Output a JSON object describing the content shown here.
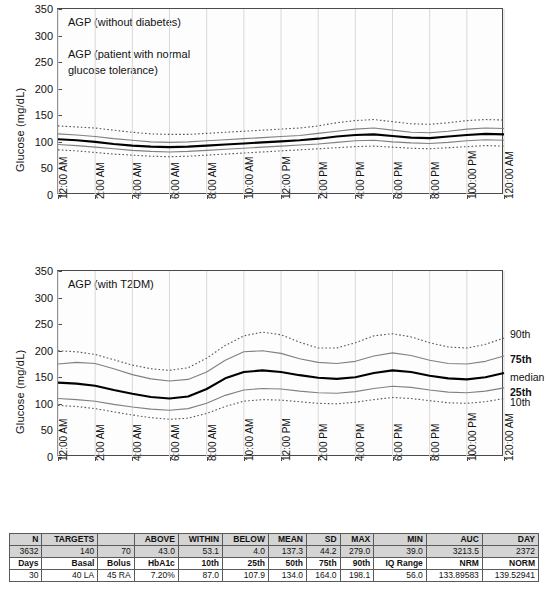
{
  "charts": [
    {
      "id": "agp-without-diabetes",
      "title": "AGP (without diabetes)\n\nAGP (patient with normal\nglucose tolerance)",
      "ylabel": "Glucose (mg/dL)",
      "yticks": [
        "0",
        "50",
        "100",
        "150",
        "200",
        "250",
        "300",
        "350"
      ],
      "xticks": [
        "12:00 AM",
        "2:00 AM",
        "4:00 AM",
        "6:00 AM",
        "8:00 AM",
        "10:00 AM",
        "12:00 PM",
        "2:00 PM",
        "4:00 PM",
        "6:00 PM",
        "8:00 PM",
        "100:00 PM",
        "120:00 AM"
      ],
      "legend": []
    },
    {
      "id": "agp-with-t2dm",
      "title": "AGP (with T2DM)",
      "ylabel": "Glucose (mg/dL)",
      "yticks": [
        "0",
        "50",
        "100",
        "150",
        "200",
        "250",
        "300",
        "350"
      ],
      "xticks": [
        "12:00 AM",
        "2:00 AM",
        "4:00 AM",
        "6:00 AM",
        "8:00 AM",
        "10:00 AM",
        "12:00 PM",
        "2:00 PM",
        "4:00 PM",
        "6:00 PM",
        "8:00 PM",
        "100:00 PM",
        "120:00 AM"
      ],
      "legend": [
        {
          "label": "90th",
          "value": 232,
          "bold": false
        },
        {
          "label": "75th",
          "value": 185,
          "bold": true
        },
        {
          "label": "median",
          "value": 150,
          "bold": false
        },
        {
          "label": "25th",
          "value": 122,
          "bold": true
        },
        {
          "label": "10th",
          "value": 103,
          "bold": false
        }
      ]
    }
  ],
  "chart_data": [
    {
      "type": "line",
      "title": "AGP (without diabetes)",
      "subtitle": "AGP (patient with normal glucose tolerance)",
      "xlabel": "",
      "ylabel": "Glucose (mg/dL)",
      "ylim": [
        0,
        350
      ],
      "grid": true,
      "legend_position": "none",
      "x": [
        "12:00 AM",
        "1:00 AM",
        "2:00 AM",
        "3:00 AM",
        "4:00 AM",
        "5:00 AM",
        "6:00 AM",
        "7:00 AM",
        "8:00 AM",
        "9:00 AM",
        "10:00 AM",
        "11:00 AM",
        "12:00 PM",
        "1:00 PM",
        "2:00 PM",
        "3:00 PM",
        "4:00 PM",
        "5:00 PM",
        "6:00 PM",
        "7:00 PM",
        "8:00 PM",
        "9:00 PM",
        "10:00 PM",
        "11:00 PM",
        "12:00 AM"
      ],
      "series": [
        {
          "name": "90th",
          "style": "dotted",
          "values": [
            130,
            128,
            126,
            122,
            118,
            115,
            114,
            114,
            116,
            118,
            120,
            122,
            124,
            126,
            130,
            136,
            140,
            142,
            138,
            134,
            133,
            136,
            140,
            142,
            141
          ]
        },
        {
          "name": "75th",
          "style": "thin",
          "values": [
            115,
            113,
            110,
            106,
            103,
            100,
            99,
            100,
            102,
            104,
            106,
            108,
            110,
            112,
            116,
            120,
            124,
            126,
            122,
            118,
            117,
            120,
            124,
            126,
            125
          ]
        },
        {
          "name": "median",
          "style": "thick",
          "values": [
            105,
            103,
            100,
            96,
            93,
            91,
            90,
            91,
            93,
            95,
            97,
            99,
            101,
            103,
            106,
            110,
            113,
            114,
            111,
            108,
            107,
            110,
            113,
            115,
            114
          ]
        },
        {
          "name": "25th",
          "style": "thin",
          "values": [
            95,
            93,
            90,
            87,
            84,
            82,
            81,
            82,
            84,
            86,
            88,
            90,
            92,
            94,
            96,
            99,
            102,
            103,
            100,
            98,
            97,
            99,
            102,
            104,
            103
          ]
        },
        {
          "name": "10th",
          "style": "dotted",
          "values": [
            85,
            83,
            80,
            77,
            75,
            73,
            72,
            73,
            75,
            77,
            79,
            81,
            83,
            85,
            87,
            89,
            91,
            92,
            90,
            88,
            87,
            89,
            91,
            93,
            92
          ]
        }
      ]
    },
    {
      "type": "line",
      "title": "AGP (with T2DM)",
      "xlabel": "",
      "ylabel": "Glucose (mg/dL)",
      "ylim": [
        0,
        350
      ],
      "grid": true,
      "legend_position": "right",
      "x": [
        "12:00 AM",
        "1:00 AM",
        "2:00 AM",
        "3:00 AM",
        "4:00 AM",
        "5:00 AM",
        "6:00 AM",
        "7:00 AM",
        "8:00 AM",
        "9:00 AM",
        "10:00 AM",
        "11:00 AM",
        "12:00 PM",
        "1:00 PM",
        "2:00 PM",
        "3:00 PM",
        "4:00 PM",
        "5:00 PM",
        "6:00 PM",
        "7:00 PM",
        "8:00 PM",
        "9:00 PM",
        "10:00 PM",
        "11:00 PM",
        "12:00 AM"
      ],
      "series": [
        {
          "name": "90th",
          "style": "dotted",
          "values": [
            200,
            198,
            193,
            183,
            173,
            166,
            163,
            168,
            186,
            210,
            228,
            235,
            230,
            216,
            205,
            205,
            215,
            228,
            232,
            226,
            215,
            207,
            205,
            212,
            224
          ]
        },
        {
          "name": "75th",
          "style": "thin",
          "values": [
            175,
            178,
            176,
            166,
            155,
            147,
            143,
            146,
            160,
            182,
            198,
            200,
            195,
            185,
            178,
            176,
            180,
            190,
            196,
            191,
            182,
            176,
            175,
            180,
            190
          ]
        },
        {
          "name": "median",
          "style": "thick",
          "values": [
            140,
            138,
            134,
            126,
            119,
            113,
            110,
            114,
            128,
            148,
            160,
            163,
            160,
            154,
            149,
            147,
            150,
            158,
            163,
            160,
            153,
            148,
            146,
            150,
            158
          ]
        },
        {
          "name": "25th",
          "style": "thin",
          "values": [
            110,
            108,
            105,
            99,
            94,
            90,
            88,
            91,
            101,
            116,
            126,
            129,
            128,
            124,
            121,
            120,
            123,
            129,
            133,
            131,
            126,
            122,
            121,
            124,
            130
          ]
        },
        {
          "name": "10th",
          "style": "dotted",
          "values": [
            97,
            95,
            91,
            85,
            79,
            74,
            71,
            73,
            82,
            95,
            105,
            108,
            107,
            104,
            101,
            100,
            103,
            108,
            112,
            110,
            106,
            102,
            101,
            104,
            110
          ]
        }
      ]
    }
  ],
  "table": {
    "rows": [
      {
        "shaded": true,
        "head": true,
        "cells": [
          "N",
          "TARGETS",
          "",
          "ABOVE",
          "WITHIN",
          "BELOW",
          "MEAN",
          "SD",
          "MAX",
          "MIN",
          "AUC",
          "DAY"
        ]
      },
      {
        "shaded": true,
        "head": false,
        "cells": [
          "3632",
          "140",
          "70",
          "43.0",
          "53.1",
          "4.0",
          "137.3",
          "44.2",
          "279.0",
          "39.0",
          "3213.5",
          "2372"
        ]
      },
      {
        "shaded": false,
        "head": true,
        "cells": [
          "Days",
          "Basal",
          "Bolus",
          "HbA1c",
          "10th",
          "25th",
          "50th",
          "75th",
          "90th",
          "IQ Range",
          "NRM",
          "NORM"
        ]
      },
      {
        "shaded": false,
        "head": false,
        "cells": [
          "30",
          "40 LA",
          "45 RA",
          "7.20%",
          "87.0",
          "107.9",
          "134.0",
          "164.0",
          "198.1",
          "56.0",
          "133.89583",
          "139.52941"
        ]
      }
    ]
  }
}
